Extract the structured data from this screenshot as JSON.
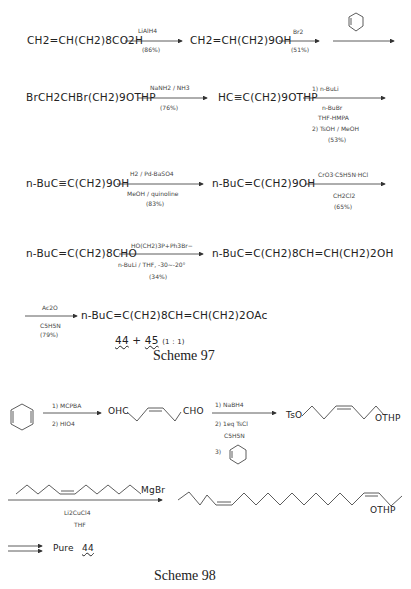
{
  "scheme97": {
    "row1": {
      "sm": "CH2=CH(CH2)8CO2H",
      "r1_top": "LiAlH4",
      "r1_bot": "(86%)",
      "p1": "CH2=CH(CH2)9OH",
      "r2_top": "Br2",
      "r2_bot": "(51%)",
      "r3_top": "dihydropyran"
    },
    "row2": {
      "sm": "BrCH2CHBr(CH2)9OTHP",
      "r_top": "NaNH2 / NH3",
      "r_bot": "(76%)",
      "p": "HC≡C(CH2)9OTHP",
      "r2_l1": "1) n-BuLi",
      "r2_l2": "n-BuBr",
      "r2_l3": "THF-HMPA",
      "r2_l4": "2) TsOH / MeOH",
      "r2_l5": "(53%)"
    },
    "row3": {
      "sm": "n-BuC≡C(CH2)9OH",
      "r_top": "H2 / Pd-BaSO4",
      "r_mid": "MeOH / quinoline",
      "r_bot": "(83%)",
      "p": "n-BuC=C(CH2)9OH",
      "r2_top": "CrO3·C5H5N·HCl",
      "r2_mid": "CH2Cl2",
      "r2_bot": "(65%)"
    },
    "row4": {
      "sm": "n-BuC=C(CH2)8CHO",
      "r_top": "HO(CH2)3P+Ph3Br−",
      "r_mid": "n-BuLi / THF, -30~-20°",
      "r_bot": "(34%)",
      "p": "n-BuC=C(CH2)8CH=CH(CH2)2OH"
    },
    "row5": {
      "r_top": "Ac2O",
      "r_mid": "C5H5N",
      "r_bot": "(79%)",
      "p": "n-BuC=C(CH2)8CH=CH(CH2)2OAc",
      "mix_a": "44",
      "plus": "+",
      "mix_b": "45",
      "ratio": "(1 : 1)"
    },
    "caption": "Scheme 97"
  },
  "scheme98": {
    "r1_l1": "1) MCPBA",
    "r1_l2": "2) HIO4",
    "p1_left": "OHC",
    "p1_right": "CHO",
    "r2_l1": "1) NaBH4",
    "r2_l2": "2) 1eq TsCl",
    "r2_l3": "C5H5N",
    "r2_l4": "3)",
    "p2_left": "TsO",
    "p2_right": "OTHP",
    "grignard": "MgBr",
    "r3_l1": "Li2CuCl4",
    "r3_l2": "THF",
    "p3_right": "OTHP",
    "final_label": "Pure",
    "final_compound": "44",
    "caption": "Scheme 98"
  }
}
